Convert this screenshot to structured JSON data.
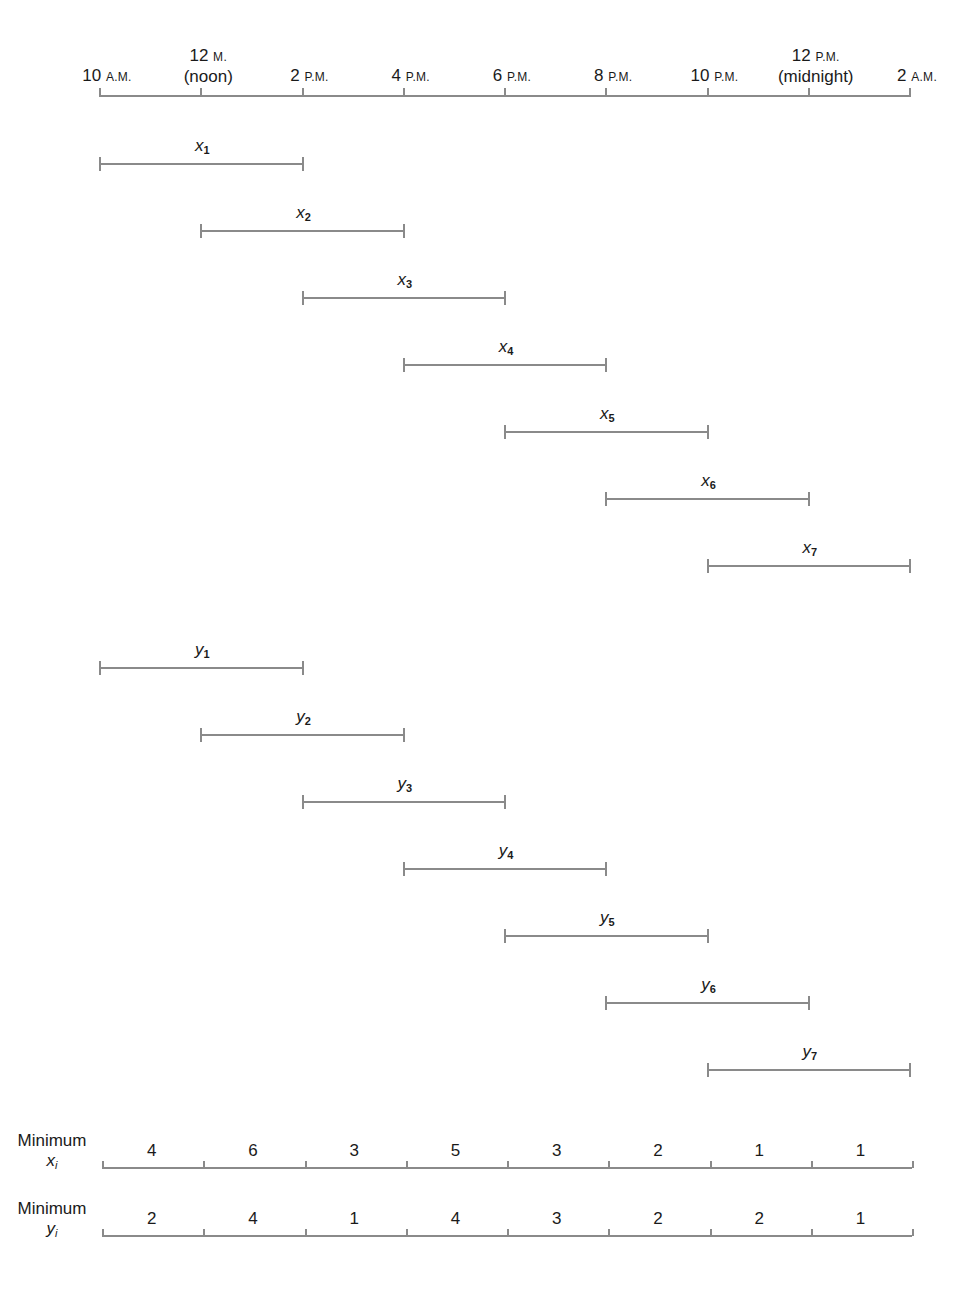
{
  "axis": {
    "ticks": [
      {
        "num": "10",
        "unit": "A.M.",
        "line1": "",
        "line2": ""
      },
      {
        "num": "12",
        "unit": "M.",
        "line1": "12 M.",
        "line2": "(noon)"
      },
      {
        "num": "2",
        "unit": "P.M.",
        "line1": "",
        "line2": ""
      },
      {
        "num": "4",
        "unit": "P.M.",
        "line1": "",
        "line2": ""
      },
      {
        "num": "6",
        "unit": "P.M.",
        "line1": "",
        "line2": ""
      },
      {
        "num": "8",
        "unit": "P.M.",
        "line1": "",
        "line2": ""
      },
      {
        "num": "10",
        "unit": "P.M.",
        "line1": "",
        "line2": ""
      },
      {
        "num": "12",
        "unit": "P.M.",
        "line1": "12 P.M.",
        "line2": "(midnight)"
      },
      {
        "num": "2",
        "unit": "A.M.",
        "line1": "",
        "line2": ""
      }
    ]
  },
  "x_intervals": [
    {
      "var": "x",
      "sub": "1",
      "start": 0,
      "end": 2
    },
    {
      "var": "x",
      "sub": "2",
      "start": 1,
      "end": 3
    },
    {
      "var": "x",
      "sub": "3",
      "start": 2,
      "end": 4
    },
    {
      "var": "x",
      "sub": "4",
      "start": 3,
      "end": 5
    },
    {
      "var": "x",
      "sub": "5",
      "start": 4,
      "end": 6
    },
    {
      "var": "x",
      "sub": "6",
      "start": 5,
      "end": 7
    },
    {
      "var": "x",
      "sub": "7",
      "start": 6,
      "end": 8
    }
  ],
  "y_intervals": [
    {
      "var": "y",
      "sub": "1",
      "start": 0,
      "end": 2
    },
    {
      "var": "y",
      "sub": "2",
      "start": 1,
      "end": 3
    },
    {
      "var": "y",
      "sub": "3",
      "start": 2,
      "end": 4
    },
    {
      "var": "y",
      "sub": "4",
      "start": 3,
      "end": 5
    },
    {
      "var": "y",
      "sub": "5",
      "start": 4,
      "end": 6
    },
    {
      "var": "y",
      "sub": "6",
      "start": 5,
      "end": 7
    },
    {
      "var": "y",
      "sub": "7",
      "start": 6,
      "end": 8
    }
  ],
  "minimum_rows": [
    {
      "label_line1": "Minimum",
      "var": "x",
      "sub": "i",
      "values": [
        "4",
        "6",
        "3",
        "5",
        "3",
        "2",
        "1",
        "1"
      ]
    },
    {
      "label_line1": "Minimum",
      "var": "y",
      "sub": "i",
      "values": [
        "2",
        "4",
        "1",
        "4",
        "3",
        "2",
        "2",
        "1"
      ]
    }
  ]
}
